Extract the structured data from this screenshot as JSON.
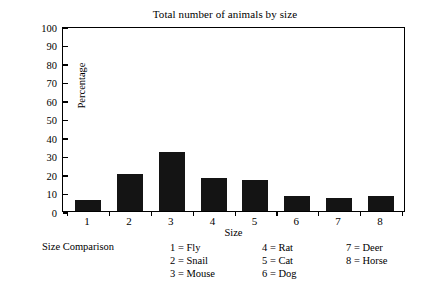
{
  "chart_data": {
    "type": "bar",
    "title": "Total number of animals by size",
    "xlabel": "Size",
    "ylabel": "Percentage",
    "categories": [
      "1",
      "2",
      "3",
      "4",
      "5",
      "6",
      "7",
      "8"
    ],
    "values": [
      6,
      20,
      32,
      18,
      17,
      8,
      7,
      8
    ],
    "ylim": [
      0,
      100
    ],
    "yticks": [
      0,
      10,
      20,
      30,
      40,
      50,
      60,
      70,
      80,
      90,
      100
    ],
    "ytick_labels": [
      "0",
      "10",
      "20",
      "30",
      "40",
      "50",
      "60",
      "70",
      "80",
      "90",
      "100"
    ],
    "grid": false,
    "legend_position": "below-axis",
    "bar_color": "#141414",
    "axis_color": "#000000",
    "background_color": "#ffffff"
  },
  "legend": {
    "title": "Size Comparison",
    "columns": [
      [
        "1  =  Fly",
        "2  =  Snail",
        "3  =  Mouse"
      ],
      [
        "4  =  Rat",
        "5  =  Cat",
        "6  =  Dog"
      ],
      [
        "7  =  Deer",
        "8  =  Horse"
      ]
    ]
  }
}
